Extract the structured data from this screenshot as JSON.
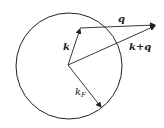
{
  "diagram": {
    "labels": {
      "k": "k",
      "q": "q",
      "k_plus_q": "k+q",
      "k_F": "k",
      "k_F_sub": "F"
    },
    "colors": {
      "stroke": "#222222",
      "background": "#ffffff"
    },
    "circle": {
      "cx": 69,
      "cy": 66,
      "r": 54
    },
    "origin": {
      "x": 68,
      "y": 65
    },
    "k_tip": {
      "x": 80,
      "y": 29
    },
    "q_tip": {
      "x": 155,
      "y": 25
    },
    "kF_tip": {
      "x": 101,
      "y": 107
    }
  }
}
